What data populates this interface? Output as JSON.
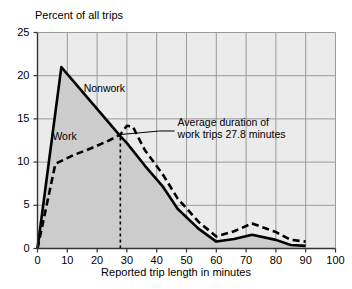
{
  "chart_data": {
    "type": "line",
    "title": "",
    "xlabel": "Reported trip length in minutes",
    "ylabel": "Percent of all trips",
    "xlim": [
      0,
      100
    ],
    "ylim": [
      0,
      25
    ],
    "xticks": [
      0,
      10,
      20,
      30,
      40,
      50,
      60,
      70,
      80,
      90,
      100
    ],
    "yticks": [
      0,
      5,
      10,
      15,
      20,
      25
    ],
    "grid": true,
    "legend_position": "inline-labels",
    "series": [
      {
        "name": "Nonwork",
        "style": "solid",
        "color": "#000000",
        "filled": true,
        "fill_color": "#cccccc",
        "x": [
          0,
          8,
          27.8,
          30,
          36,
          42,
          47,
          54,
          60,
          66,
          72,
          80,
          85,
          90
        ],
        "values": [
          0,
          21.0,
          13.0,
          12.2,
          9.6,
          7.2,
          4.6,
          2.3,
          0.8,
          1.1,
          1.6,
          1.0,
          0.4,
          0.3
        ]
      },
      {
        "name": "Work",
        "style": "dashed",
        "color": "#000000",
        "filled": false,
        "x": [
          0,
          6,
          12,
          18,
          24,
          27.8,
          30,
          32,
          36,
          42,
          47,
          54,
          60,
          66,
          72,
          80,
          85,
          90
        ],
        "values": [
          0,
          9.8,
          10.8,
          11.6,
          12.5,
          13.2,
          14.2,
          14.1,
          11.4,
          8.6,
          5.8,
          3.1,
          1.4,
          2.0,
          2.9,
          1.9,
          1.0,
          0.8
        ]
      }
    ],
    "annotations": [
      {
        "name": "average-duration-annotation",
        "text_line1": "Average duration of",
        "text_line2": "work trips 27.8 minutes",
        "marker_x": 27.8,
        "marker_style": "vertical-dashed-line",
        "marker_top_value": 13.2
      }
    ],
    "colors": {
      "plot_background": "#ebebeb",
      "grid": "#9a9a9a",
      "axis": "#333333",
      "fill_nonwork": "#cccccc",
      "line": "#000000"
    }
  },
  "labels": {
    "series_nonwork": "Nonwork",
    "series_work": "Work",
    "annotation_line1": "Average duration of",
    "annotation_line2": "work trips 27.8 minutes",
    "y_axis_title": "Percent of all trips",
    "x_axis_title": "Reported trip length in minutes"
  },
  "ticks": {
    "y": [
      "25",
      "20",
      "15",
      "10",
      "5",
      "0"
    ],
    "x": [
      "0",
      "10",
      "20",
      "30",
      "40",
      "50",
      "60",
      "70",
      "80",
      "90",
      "100"
    ]
  }
}
